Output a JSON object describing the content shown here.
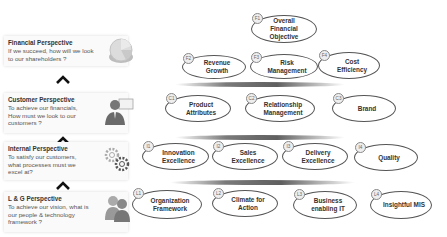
{
  "perspectives": [
    {
      "title": "Financial Perspective",
      "desc": "If we succeed, how will we look to our shareholders ?",
      "icon": "pie-chart-icon"
    },
    {
      "title": "Customer Perspective",
      "desc": "To achieve our financials, How must we look to our customers ?",
      "icon": "businessman-icon"
    },
    {
      "title": "Internal Perspective",
      "desc": "To satisfy our customers, what processes must we excel at?",
      "icon": "gears-icon"
    },
    {
      "title": "L & G Perspective",
      "desc": "To achieve our vision, what is our people & technology framework ?",
      "icon": "people-icon"
    }
  ],
  "arrows": [
    "chevron-up-icon",
    "chevron-up-icon",
    "chevron-up-icon"
  ],
  "financial": [
    {
      "badge": "F1",
      "label": "Overall Financial Objective"
    },
    {
      "badge": "F2",
      "label": "Revenue Growth"
    },
    {
      "badge": "F3",
      "label": "Risk Management"
    },
    {
      "badge": "F4",
      "label": "Cost Efficiency"
    }
  ],
  "customer": [
    {
      "badge": "C1",
      "label": "Product Attributes"
    },
    {
      "badge": "C2",
      "label": "Relationship Management"
    },
    {
      "badge": "C3",
      "label": "Brand"
    }
  ],
  "internal": [
    {
      "badge": "I1",
      "label": "Innovation Excellence"
    },
    {
      "badge": "I2",
      "label": "Sales Excellence"
    },
    {
      "badge": "I3",
      "label": "Delivery Excellence"
    },
    {
      "badge": "I4",
      "label": "Quality"
    }
  ],
  "learning": [
    {
      "badge": "L1",
      "label": "Organization Framework"
    },
    {
      "badge": "L2",
      "label": "Climate for Action"
    },
    {
      "badge": "L3",
      "label": "Business enabling IT"
    },
    {
      "badge": "L4",
      "label": "Insightful MIS"
    }
  ],
  "colors": {
    "ellipse_border": "#555555",
    "bar": "#6a6a6a",
    "text": "#333333"
  }
}
